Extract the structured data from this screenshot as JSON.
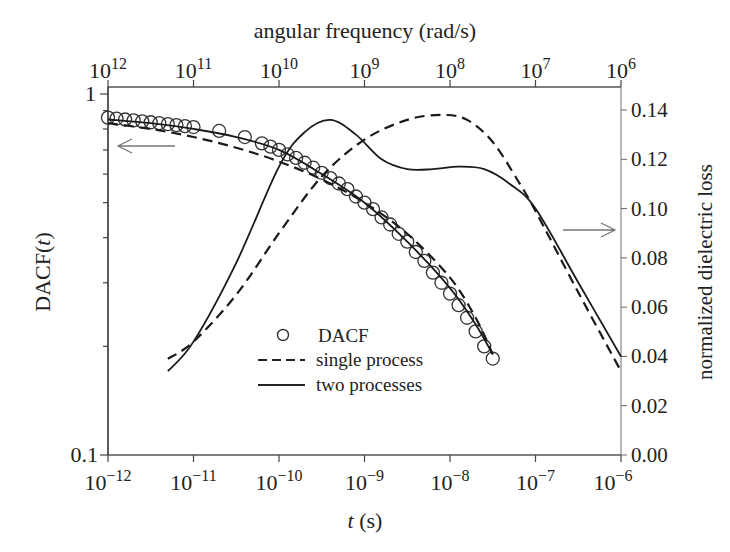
{
  "chart_data": {
    "type": "line",
    "title": "",
    "top_axis": {
      "label": "angular frequency (rad/s)",
      "ticks": [
        "10^12",
        "10^11",
        "10^10",
        "10^9",
        "10^8",
        "10^7",
        "10^6"
      ],
      "scale": "log",
      "range": [
        1000000000000.0,
        1000000.0
      ]
    },
    "x_axis": {
      "label_italic": "t",
      "label_rest": " (s)",
      "ticks": [
        "10^-12",
        "10^-11",
        "10^-10",
        "10^-9",
        "10^-8",
        "10^-7",
        "10^-6"
      ],
      "scale": "log",
      "range": [
        1e-12,
        1e-06
      ]
    },
    "left_axis": {
      "label_prefix": "DACF(",
      "label_italic": "t",
      "label_suffix": ")",
      "ticks": [
        "1",
        "0.1"
      ],
      "scale": "log",
      "range": [
        0.1,
        1
      ]
    },
    "right_axis": {
      "label": "normalized dielectric loss",
      "ticks": [
        "0.00",
        "0.02",
        "0.04",
        "0.06",
        "0.08",
        "0.10",
        "0.12",
        "0.14"
      ],
      "scale": "linear",
      "range": [
        0.0,
        0.14
      ]
    },
    "legend": [
      {
        "marker": "circle",
        "label": "DACF"
      },
      {
        "marker": "dashed",
        "label": "single process"
      },
      {
        "marker": "solid",
        "label": "two processes"
      }
    ],
    "series": [
      {
        "name": "DACF",
        "axis": "left",
        "style": "circles",
        "x_log10_t": [
          -12.0,
          -11.9,
          -11.8,
          -11.7,
          -11.6,
          -11.5,
          -11.4,
          -11.3,
          -11.2,
          -11.1,
          -11.0,
          -10.7,
          -10.4,
          -10.2,
          -10.1,
          -10.0,
          -9.9,
          -9.8,
          -9.7,
          -9.6,
          -9.5,
          -9.4,
          -9.3,
          -9.2,
          -9.1,
          -9.0,
          -8.9,
          -8.8,
          -8.7,
          -8.6,
          -8.5,
          -8.4,
          -8.3,
          -8.2,
          -8.1,
          -8.0,
          -7.9,
          -7.8,
          -7.7,
          -7.6,
          -7.5
        ],
        "values": [
          0.86,
          0.855,
          0.85,
          0.845,
          0.84,
          0.835,
          0.83,
          0.825,
          0.82,
          0.815,
          0.81,
          0.79,
          0.76,
          0.73,
          0.715,
          0.7,
          0.68,
          0.665,
          0.645,
          0.625,
          0.605,
          0.585,
          0.565,
          0.545,
          0.52,
          0.5,
          0.48,
          0.455,
          0.435,
          0.41,
          0.39,
          0.365,
          0.345,
          0.32,
          0.3,
          0.28,
          0.26,
          0.24,
          0.22,
          0.2,
          0.185
        ]
      },
      {
        "name": "single process (DACF fit)",
        "axis": "left",
        "style": "dashed",
        "x_log10_t": [
          -12.0,
          -11.5,
          -11.0,
          -10.5,
          -10.0,
          -9.5,
          -9.0,
          -8.5,
          -8.0,
          -7.7,
          -7.5
        ],
        "values": [
          0.83,
          0.8,
          0.76,
          0.71,
          0.65,
          0.58,
          0.5,
          0.41,
          0.31,
          0.24,
          0.19
        ]
      },
      {
        "name": "two processes (DACF fit)",
        "axis": "left",
        "style": "solid",
        "x_log10_t": [
          -12.0,
          -11.5,
          -11.0,
          -10.5,
          -10.0,
          -9.5,
          -9.0,
          -8.5,
          -8.0,
          -7.7,
          -7.5
        ],
        "values": [
          0.85,
          0.83,
          0.8,
          0.76,
          0.7,
          0.6,
          0.5,
          0.39,
          0.29,
          0.23,
          0.19
        ]
      },
      {
        "name": "single process (dielectric loss)",
        "axis": "right",
        "style": "dashed",
        "x_log10_t": [
          -11.3,
          -11.0,
          -10.5,
          -10.0,
          -9.5,
          -9.0,
          -8.5,
          -8.1,
          -7.8,
          -7.5,
          -7.2,
          -7.0,
          -6.5,
          -6.0
        ],
        "values": [
          0.039,
          0.046,
          0.065,
          0.09,
          0.113,
          0.128,
          0.136,
          0.138,
          0.136,
          0.127,
          0.111,
          0.099,
          0.066,
          0.034
        ],
        "peak": {
          "x_log10_t": -8.1,
          "value": 0.138
        }
      },
      {
        "name": "two processes (dielectric loss)",
        "axis": "right",
        "style": "solid",
        "x_log10_t": [
          -11.3,
          -11.0,
          -10.5,
          -10.0,
          -9.7,
          -9.4,
          -9.1,
          -8.8,
          -8.5,
          -8.2,
          -7.9,
          -7.6,
          -7.3,
          -7.0,
          -6.5,
          -6.0
        ],
        "values": [
          0.034,
          0.046,
          0.078,
          0.117,
          0.131,
          0.136,
          0.13,
          0.12,
          0.116,
          0.116,
          0.117,
          0.116,
          0.11,
          0.1,
          0.07,
          0.04
        ],
        "peak": {
          "x_log10_t": -9.4,
          "value": 0.136
        }
      }
    ],
    "annotations": [
      {
        "type": "arrow",
        "direction": "left",
        "meaning": "DACF curves read on left axis"
      },
      {
        "type": "arrow",
        "direction": "right",
        "meaning": "loss curves read on right axis"
      }
    ],
    "grid": false,
    "legend_position": "lower-center"
  }
}
